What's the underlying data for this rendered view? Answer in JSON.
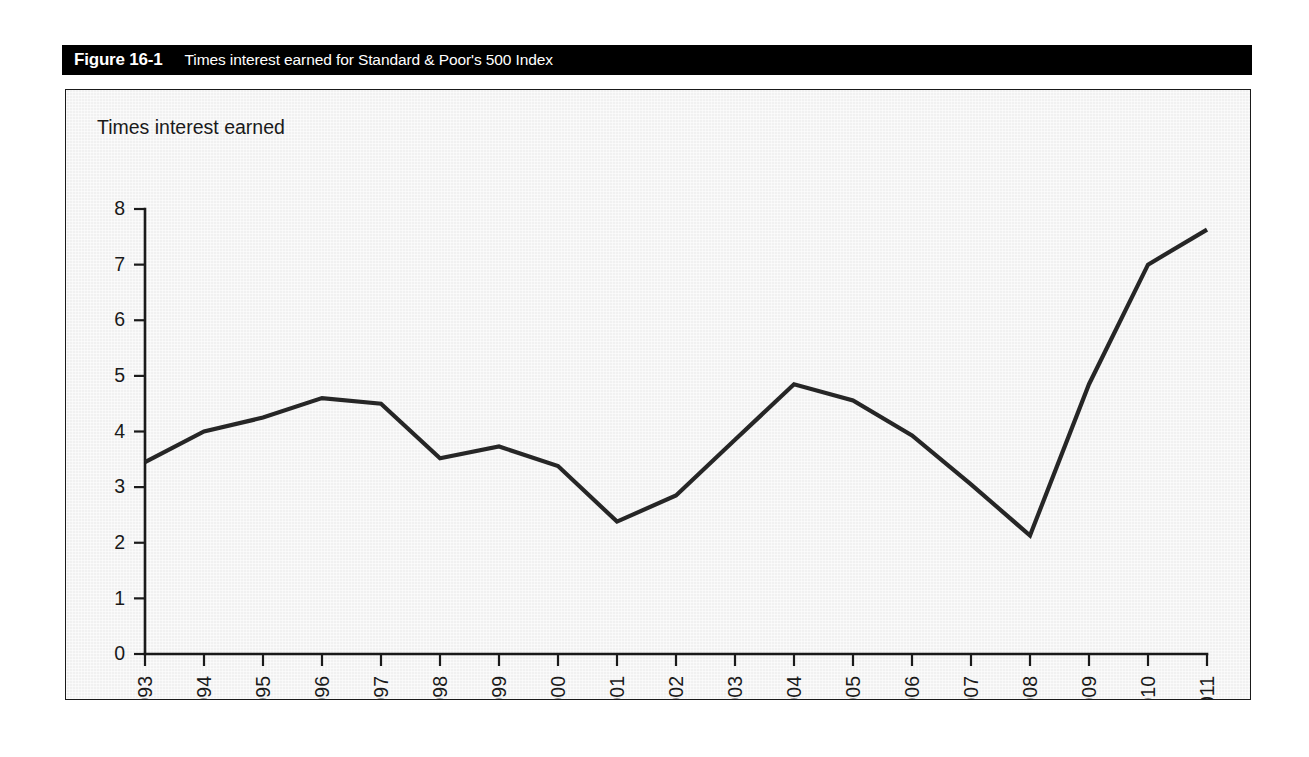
{
  "figure": {
    "number": "Figure 16-1",
    "caption": "Times interest earned for Standard & Poor's 500 Index"
  },
  "colors": {
    "title_bar_background": "#000000",
    "title_bar_text": "#ffffff",
    "plot_background": "#f1f1f1",
    "frame_border": "#1a1a1a",
    "data_line": "#262626",
    "axis": "#1a1a1a"
  },
  "chart_data": {
    "type": "line",
    "title": "Times interest earned for Standard & Poor's 500 Index",
    "ylabel": "Times interest earned",
    "xlabel": "",
    "ylim": [
      0,
      8
    ],
    "yticks": [
      0,
      1,
      2,
      3,
      4,
      5,
      6,
      7,
      8
    ],
    "ytick_labels": [
      "0",
      "1",
      "2",
      "3",
      "4",
      "5",
      "6",
      "7",
      "8"
    ],
    "grid": false,
    "legend": false,
    "x_tick_rotation": 90,
    "categories": [
      "1993",
      "1994",
      "1995",
      "1996",
      "1997",
      "1998",
      "1999",
      "2000",
      "2001",
      "2002",
      "2003",
      "2004",
      "2005",
      "2006",
      "2007",
      "2008",
      "2009",
      "2010",
      "2011"
    ],
    "values": [
      3.45,
      4.0,
      4.25,
      4.6,
      4.5,
      3.52,
      3.73,
      3.38,
      2.38,
      2.85,
      3.85,
      4.85,
      4.56,
      3.93,
      3.05,
      2.13,
      4.85,
      7.0,
      7.63
    ]
  }
}
